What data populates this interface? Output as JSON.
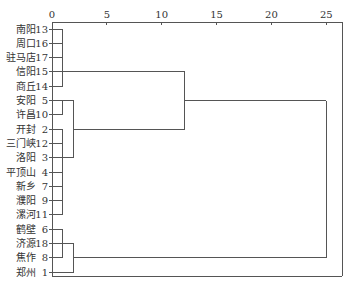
{
  "chart_data": {
    "type": "dendrogram",
    "title": "",
    "xlabel": "",
    "ylabel": "",
    "xlim": [
      0,
      25
    ],
    "x_ticks": [
      0,
      5,
      10,
      15,
      20,
      25
    ],
    "grid": false,
    "orientation": "horizontal",
    "leaves": [
      {
        "name": "南阳",
        "id": 13
      },
      {
        "name": "周口",
        "id": 16
      },
      {
        "name": "驻马店",
        "id": 17
      },
      {
        "name": "信阳",
        "id": 15
      },
      {
        "name": "商丘",
        "id": 14
      },
      {
        "name": "安阳",
        "id": 5
      },
      {
        "name": "许昌",
        "id": 10
      },
      {
        "name": "开封",
        "id": 2
      },
      {
        "name": "三门峡",
        "id": 12
      },
      {
        "name": "洛阳",
        "id": 3
      },
      {
        "name": "平顶山",
        "id": 4
      },
      {
        "name": "新乡",
        "id": 7
      },
      {
        "name": "濮阳",
        "id": 9
      },
      {
        "name": "漯河",
        "id": 11
      },
      {
        "name": "鹤壁",
        "id": 6
      },
      {
        "name": "济源",
        "id": 18
      },
      {
        "name": "焦作",
        "id": 8
      },
      {
        "name": "郑州",
        "id": 1
      }
    ],
    "merges": [
      {
        "cluster": "A",
        "members": [
          13,
          16,
          17,
          15,
          14
        ],
        "distance": 1.0,
        "span_rows": [
          0,
          4
        ],
        "out_row": 3
      },
      {
        "cluster": "B",
        "members": [
          5,
          10
        ],
        "distance": 1.0,
        "span_rows": [
          5,
          6
        ],
        "out_row": 5
      },
      {
        "cluster": "C",
        "members": [
          2,
          12,
          3,
          4,
          7,
          9,
          11
        ],
        "distance": 1.0,
        "span_rows": [
          7,
          13
        ],
        "out_row": 9
      },
      {
        "cluster": "BC",
        "members": [
          "B",
          "C"
        ],
        "distance": 2.0,
        "from_rows": [
          5,
          9
        ],
        "out_y_row": 7
      },
      {
        "cluster": "ABC",
        "members": [
          "A",
          "BC"
        ],
        "distance": 12.1,
        "from_rows": [
          3,
          7
        ],
        "out_y_row": 5
      },
      {
        "cluster": "D",
        "members": [
          6,
          8
        ],
        "distance": 1.0,
        "span_rows": [
          14,
          16
        ],
        "out_row": 15
      },
      {
        "cluster": "DE",
        "members": [
          "D",
          1
        ],
        "distance": 2.0,
        "from_rows": [
          15,
          17
        ],
        "out_y_row": 16
      },
      {
        "cluster": "ALL",
        "members": [
          "ABC",
          "DE"
        ],
        "distance": 25.0,
        "from_rows": [
          5,
          16
        ]
      }
    ]
  },
  "colors": {
    "line": "#555555",
    "text": "#333333",
    "background": "#ffffff"
  }
}
